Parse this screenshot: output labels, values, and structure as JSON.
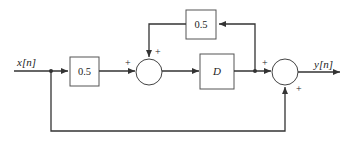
{
  "diagram": {
    "type": "block-diagram",
    "input_label": "x[n]",
    "output_label": "y[n]",
    "blocks": {
      "gain_input": "0.5",
      "gain_feedback": "0.5",
      "delay": "D"
    },
    "summers": {
      "summer1": {
        "sign_left": "+",
        "sign_top": "+"
      },
      "summer2": {
        "sign_left": "+",
        "sign_bottom": "+"
      }
    },
    "colors": {
      "line": "#333333",
      "block_border": "#555555",
      "background": "#ffffff"
    }
  }
}
